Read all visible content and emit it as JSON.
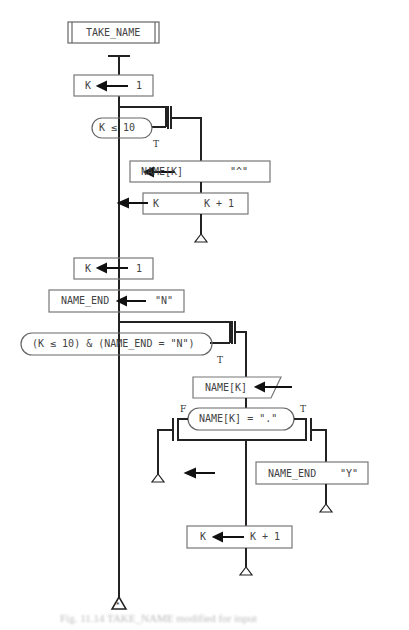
{
  "diagram": {
    "type": "flowchart",
    "title_block": "TAKE_NAME",
    "loop1": {
      "init": {
        "target": "K",
        "value": "1"
      },
      "condition": "K ≤ 10",
      "true_label": "T",
      "body": [
        {
          "target": "NAME[K]",
          "value": "\"^\""
        },
        {
          "target": "K",
          "value": "K + 1"
        }
      ]
    },
    "loop2": {
      "init": {
        "target": "K",
        "value": "1"
      },
      "init2": {
        "target": "NAME_END",
        "value": "\"N\""
      },
      "condition": "(K ≤ 10) & (NAME_END = \"N\")",
      "true_label": "T",
      "input": "NAME[K]",
      "decision": {
        "condition": "NAME[K] = \".\"",
        "false_label": "F",
        "true_label": "T",
        "true_action": {
          "target": "NAME_END",
          "value": "\"Y\""
        }
      },
      "increment": {
        "target": "K",
        "value": "K + 1"
      }
    },
    "end_marker": "*",
    "caption": "Fig. 11.14  TAKE_NAME modified for input"
  }
}
